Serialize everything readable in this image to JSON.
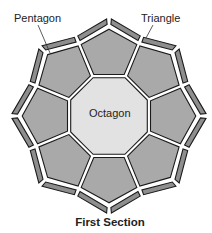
{
  "diagram": {
    "caption": "First Section",
    "labels": {
      "pentagon": "Pentagon",
      "triangle": "Triangle",
      "octagon": "Octagon"
    },
    "colors": {
      "octagon_fill": "#e2e2e2",
      "pentagon_fill": "#a9a9a9",
      "triangle_fill": "#8e8e8e",
      "outline": "#1a1a1a",
      "gap": "#ffffff"
    },
    "geometry": {
      "center": [
        109,
        116
      ],
      "octagon_vertex_radius": 43,
      "pentagon_shoulder_radius": 78,
      "pentagon_tip_radius": 89,
      "triangle_outer_tip_radius": 97,
      "triangle_outer_shoulder_radius": 86,
      "sides": 8
    },
    "counts": {
      "octagons": 1,
      "pentagons": 8,
      "triangles": 16
    }
  }
}
